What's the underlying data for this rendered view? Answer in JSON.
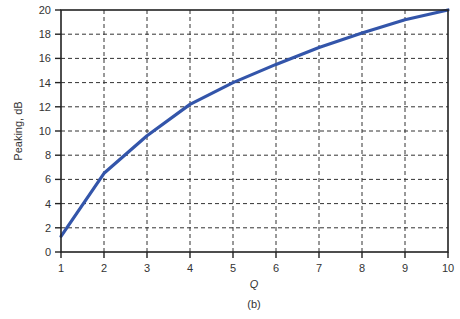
{
  "chart_data": {
    "type": "line",
    "title": "",
    "caption": "(b)",
    "xlabel": "Q",
    "ylabel": "Peaking, dB",
    "xlim": [
      1,
      10
    ],
    "ylim": [
      0,
      20
    ],
    "xticks": [
      1,
      2,
      3,
      4,
      5,
      6,
      7,
      8,
      9,
      10
    ],
    "yticks": [
      0,
      2,
      4,
      6,
      8,
      10,
      12,
      14,
      16,
      18,
      20
    ],
    "grid": true,
    "grid_style": "dashed",
    "legend": null,
    "series": [
      {
        "name": "Peaking",
        "color": "#3355aa",
        "x": [
          1,
          2,
          3,
          4,
          5,
          6,
          7,
          8,
          9,
          10
        ],
        "values": [
          1.3,
          6.5,
          9.6,
          12.2,
          14.0,
          15.5,
          16.9,
          18.1,
          19.2,
          20.0
        ]
      }
    ]
  },
  "colors": {
    "line": "#3355aa",
    "axis": "#222222",
    "grid": "#333333",
    "text": "#333333"
  }
}
